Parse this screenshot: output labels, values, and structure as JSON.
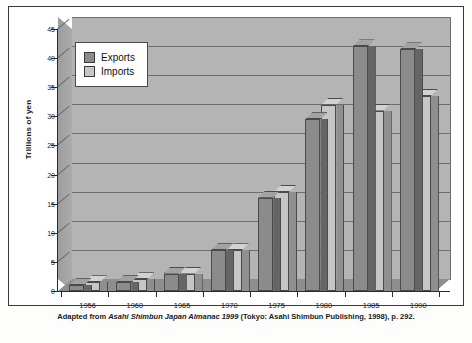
{
  "figure": {
    "ylabel": "Trillions of yen",
    "caption_part1": "Adapted from ",
    "caption_italic": "Asahi Shimbun Japan Almanac 1999",
    "caption_part2": " (Tokyo: Asahi Shimbun Publishing, 1998), p. 292."
  },
  "legend": {
    "position": "top-left-inside",
    "items": [
      {
        "label": "Exports",
        "color": "#8b8b8b"
      },
      {
        "label": "Imports",
        "color": "#c6c6c6"
      }
    ]
  },
  "colors": {
    "plot_background": "#b4b4b4",
    "gridline": "#6e6e6e",
    "axis": "#2a2a2a",
    "exports": "#8b8b8b",
    "imports": "#c6c6c6",
    "floor": "#8e8e8e",
    "page": "#fdfdfc"
  },
  "chart_data": {
    "type": "bar",
    "title": "",
    "subtitle": "",
    "xlabel": "",
    "ylabel": "Trillions of yen",
    "categories": [
      "1956",
      "1960",
      "1965",
      "1970",
      "1975",
      "1980",
      "1985",
      "1990"
    ],
    "series": [
      {
        "name": "Exports",
        "values": [
          1.0,
          1.5,
          3.0,
          7.0,
          16.0,
          29.5,
          42.0,
          41.5
        ]
      },
      {
        "name": "Imports",
        "values": [
          1.5,
          2.0,
          3.0,
          7.0,
          17.0,
          32.0,
          31.0,
          33.5
        ]
      }
    ],
    "ylim": [
      0,
      45
    ],
    "yticks": [
      0,
      5,
      10,
      15,
      20,
      25,
      30,
      35,
      40,
      45
    ],
    "ytick_labels": [
      "0",
      "5",
      "10",
      "15",
      "20",
      "25",
      "30",
      "35",
      "40",
      "45"
    ],
    "grid": true,
    "grid_axis": "y",
    "legend_entries": [
      "Exports",
      "Imports"
    ],
    "style": "3d-grouped-bars-grayscale",
    "annotations": []
  }
}
